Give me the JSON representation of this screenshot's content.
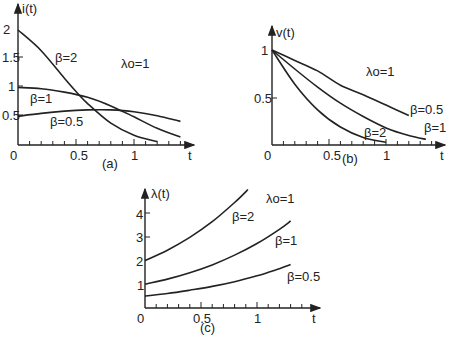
{
  "figure": {
    "background": "#ffffff",
    "ink": "#222222"
  },
  "chart_data": [
    {
      "id": "a",
      "type": "line",
      "caption": "(a)",
      "title": "",
      "xlabel": "t",
      "ylabel": "i(t)",
      "annotation": "λo=1",
      "xlim": [
        0,
        1.4
      ],
      "ylim": [
        0,
        2.1
      ],
      "xticks": [
        "0",
        "0.5",
        "1"
      ],
      "yticks": [
        "0.5",
        "1",
        "1.5",
        "2"
      ],
      "grid": false,
      "series": [
        {
          "name": "β=2",
          "x": [
            0,
            0.2,
            0.4,
            0.5,
            0.6,
            0.8,
            1.0,
            1.2
          ],
          "values": [
            2.0,
            1.64,
            1.16,
            0.93,
            0.72,
            0.38,
            0.17,
            0.06
          ]
        },
        {
          "name": "β=1",
          "x": [
            0,
            0.2,
            0.4,
            0.6,
            0.8,
            1.0,
            1.2,
            1.4
          ],
          "values": [
            1.0,
            0.98,
            0.92,
            0.83,
            0.68,
            0.49,
            0.29,
            0.14
          ]
        },
        {
          "name": "β=0.5",
          "x": [
            0,
            0.2,
            0.4,
            0.6,
            0.8,
            1.0,
            1.2,
            1.4
          ],
          "values": [
            0.5,
            0.55,
            0.59,
            0.61,
            0.61,
            0.58,
            0.51,
            0.41
          ]
        }
      ]
    },
    {
      "id": "b",
      "type": "line",
      "caption": "(b)",
      "xlabel": "t",
      "ylabel": "v(t)",
      "annotation": "λo=1",
      "xlim": [
        0,
        1.4
      ],
      "ylim": [
        0,
        1.1
      ],
      "xticks": [
        "0",
        "0.5",
        "1"
      ],
      "yticks": [
        "0.5",
        "1"
      ],
      "grid": false,
      "series": [
        {
          "name": "β=0.5",
          "x": [
            0,
            0.2,
            0.4,
            0.6,
            0.8,
            1.0,
            1.2
          ],
          "values": [
            1.0,
            0.89,
            0.78,
            0.63,
            0.53,
            0.42,
            0.31
          ]
        },
        {
          "name": "β=1",
          "x": [
            0,
            0.2,
            0.4,
            0.6,
            0.8,
            1.0,
            1.2,
            1.35
          ],
          "values": [
            1.0,
            0.8,
            0.61,
            0.44,
            0.3,
            0.18,
            0.1,
            0.06
          ]
        },
        {
          "name": "β=2",
          "x": [
            0,
            0.2,
            0.4,
            0.6,
            0.8,
            1.0
          ],
          "values": [
            1.0,
            0.64,
            0.37,
            0.19,
            0.08,
            0.03
          ]
        }
      ]
    },
    {
      "id": "c",
      "type": "line",
      "caption": "(c)",
      "xlabel": "t",
      "ylabel": "λ(t)",
      "annotation": "λo=1",
      "xlim": [
        0,
        1.4
      ],
      "ylim": [
        0,
        5
      ],
      "xticks": [
        "0",
        "0.5",
        "1"
      ],
      "yticks": [
        "1",
        "2",
        "3",
        "4"
      ],
      "grid": false,
      "series": [
        {
          "name": "β=2",
          "x": [
            0,
            0.2,
            0.4,
            0.6,
            0.8,
            0.92
          ],
          "values": [
            2.0,
            2.44,
            2.98,
            3.64,
            4.45,
            5.0
          ]
        },
        {
          "name": "β=1",
          "x": [
            0,
            0.2,
            0.4,
            0.6,
            0.8,
            1.0,
            1.2,
            1.3
          ],
          "values": [
            1.0,
            1.22,
            1.49,
            1.82,
            2.23,
            2.72,
            3.32,
            3.67
          ]
        },
        {
          "name": "β=0.5",
          "x": [
            0,
            0.2,
            0.4,
            0.6,
            0.8,
            1.0,
            1.2,
            1.3
          ],
          "values": [
            0.5,
            0.61,
            0.75,
            0.91,
            1.11,
            1.36,
            1.66,
            1.83
          ]
        }
      ]
    }
  ],
  "labels": {
    "a": {
      "ylabel": "i(t)",
      "xlabel": "t",
      "caption": "(a)",
      "annot": "λo=1",
      "origin": "0",
      "yt": [
        "2",
        "1.5",
        "1",
        "0.5"
      ],
      "xt": [
        "0.5",
        "1"
      ],
      "s0": "β=2",
      "s1": "β=1",
      "s2": "β=0.5"
    },
    "b": {
      "ylabel": "v(t)",
      "xlabel": "t",
      "caption": "(b)",
      "annot": "λo=1",
      "origin": "0",
      "yt": [
        "1",
        "0.5"
      ],
      "xt": [
        "0.5",
        "1"
      ],
      "s0": "β=0.5",
      "s1": "β=1",
      "s2": "β=2"
    },
    "c": {
      "ylabel": "λ(t)",
      "xlabel": "t",
      "caption": "(c)",
      "annot": "λo=1",
      "origin": "0",
      "yt": [
        "4",
        "3",
        "2",
        "1"
      ],
      "xt": [
        "0.5",
        "1"
      ],
      "s0": "β=2",
      "s1": "β=1",
      "s2": "β=0.5"
    }
  }
}
